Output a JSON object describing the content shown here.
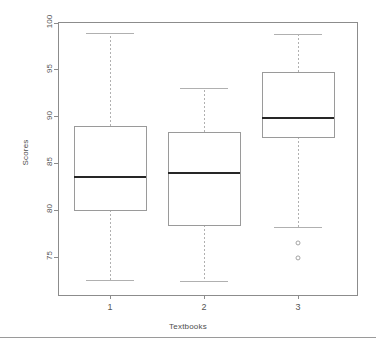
{
  "figure": {
    "background": "#ffffff",
    "frame_color": "#8c8c8c",
    "box_color": "#9a9a9a",
    "median_color": "#262626",
    "whisker_color": "#b0b0b0",
    "outlier_color": "#9a9a9a",
    "tick_color": "#8c8c8c"
  },
  "chart_data": {
    "type": "box",
    "title": "",
    "xlabel": "Textbooks",
    "ylabel": "Scores",
    "categories": [
      "1",
      "2",
      "3"
    ],
    "x_tick_labels": [
      "1",
      "2",
      "3"
    ],
    "y_tick_labels": [
      "75",
      "80",
      "85",
      "90",
      "95",
      "100"
    ],
    "y_tick_values": [
      75,
      80,
      85,
      90,
      95,
      100
    ],
    "ylim": [
      71.0,
      100.0
    ],
    "grid": false,
    "legend": null,
    "boxes": [
      {
        "category": "1",
        "whisker_low": 72.5,
        "q1": 80.0,
        "median": 83.5,
        "q3": 89.0,
        "whisker_high": 98.9,
        "outliers": []
      },
      {
        "category": "2",
        "whisker_low": 72.4,
        "q1": 78.4,
        "median": 84.0,
        "q3": 88.4,
        "whisker_high": 93.0,
        "outliers": []
      },
      {
        "category": "3",
        "whisker_low": 78.1,
        "q1": 87.8,
        "median": 89.9,
        "q3": 94.8,
        "whisker_high": 98.8,
        "outliers": [
          76.5,
          74.9
        ]
      }
    ]
  }
}
